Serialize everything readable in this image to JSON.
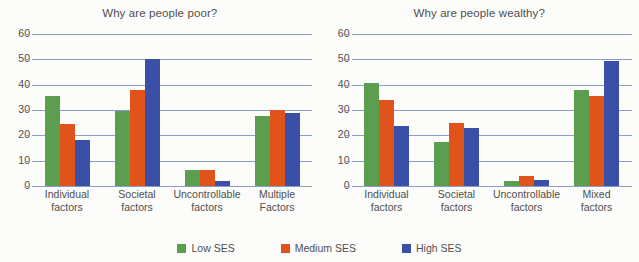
{
  "legend": {
    "position": "bottom-center",
    "entries": [
      {
        "label": "Low SES",
        "color": "#5c9e4f"
      },
      {
        "label": "Medium SES",
        "color": "#e0541c"
      },
      {
        "label": "High SES",
        "color": "#3a4fa6"
      }
    ]
  },
  "yticks": [
    "60",
    "50",
    "40",
    "30",
    "20",
    "10",
    "0"
  ],
  "chart_data": [
    {
      "type": "bar",
      "title": "Why are people poor?",
      "xlabel": "",
      "ylabel": "",
      "ylim": [
        0,
        60
      ],
      "ytick_values": [
        0,
        10,
        20,
        30,
        40,
        50,
        60
      ],
      "grid": true,
      "legend_position": "bottom-center",
      "categories": [
        {
          "line1": "Individual",
          "line2": "factors"
        },
        {
          "line1": "Societal",
          "line2": "factors"
        },
        {
          "line1": "Uncontrollable",
          "line2": "factors"
        },
        {
          "line1": "Multiple",
          "line2": "Factors"
        }
      ],
      "series": [
        {
          "name": "Low SES",
          "color": "#5c9e4f",
          "values": [
            35.5,
            29.5,
            6.5,
            27.5
          ]
        },
        {
          "name": "Medium SES",
          "color": "#e0541c",
          "values": [
            24.5,
            38,
            6.5,
            30
          ]
        },
        {
          "name": "High SES",
          "color": "#3a4fa6",
          "values": [
            18,
            50,
            2,
            29
          ]
        }
      ]
    },
    {
      "type": "bar",
      "title": "Why are people wealthy?",
      "xlabel": "",
      "ylabel": "",
      "ylim": [
        0,
        60
      ],
      "ytick_values": [
        0,
        10,
        20,
        30,
        40,
        50,
        60
      ],
      "grid": true,
      "legend_position": "bottom-center",
      "categories": [
        {
          "line1": "Individual",
          "line2": "factors"
        },
        {
          "line1": "Societal",
          "line2": "factors"
        },
        {
          "line1": "Uncontrollable",
          "line2": "factors"
        },
        {
          "line1": "Mixed",
          "line2": "factors"
        }
      ],
      "series": [
        {
          "name": "Low SES",
          "color": "#5c9e4f",
          "values": [
            40.5,
            17.5,
            2,
            38
          ]
        },
        {
          "name": "Medium SES",
          "color": "#e0541c",
          "values": [
            34,
            25,
            4,
            35.5
          ]
        },
        {
          "name": "High SES",
          "color": "#3a4fa6",
          "values": [
            23.5,
            23,
            2.5,
            49.5
          ]
        }
      ]
    }
  ]
}
